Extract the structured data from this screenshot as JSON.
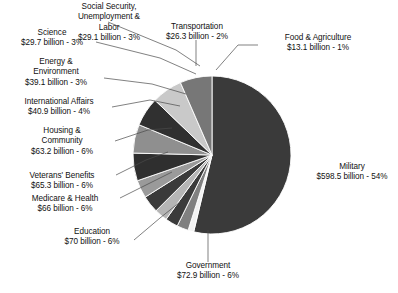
{
  "chart_data": {
    "type": "pie",
    "title": "",
    "subtitle": "",
    "xlabel": "",
    "ylabel": "",
    "legend_position": "callout-labels",
    "grid": false,
    "units": "billion USD",
    "start_angle_deg": 0,
    "direction": "clockwise",
    "categories": [
      "Military",
      "Food & Agriculture",
      "Transportation",
      "Social Security, Unemployment & Labor",
      "Science",
      "Energy & Environment",
      "International Affairs",
      "Housing & Community",
      "Veterans' Benefits",
      "Medicare & Health",
      "Education",
      "Government"
    ],
    "values": [
      598.5,
      13.1,
      26.3,
      29.1,
      29.7,
      39.1,
      40.9,
      63.2,
      65.3,
      66,
      70,
      72.9
    ],
    "percents": [
      54,
      1,
      2,
      3,
      3,
      3,
      4,
      6,
      6,
      6,
      6,
      6
    ],
    "colors": [
      "#3a3a3a",
      "#f2f2f2",
      "#808080",
      "#3a3a3a",
      "#b5b5b5",
      "#3a3a3a",
      "#9a9a9a",
      "#2f2f2f",
      "#8f8f8f",
      "#303030",
      "#c9c9c9",
      "#777777"
    ],
    "slices": [
      {
        "category": "Military",
        "value_text": "$598.5 billion",
        "percent_text": "54%",
        "label_line1": "Military",
        "label_line2": "$598.5 billion - 54%"
      },
      {
        "category": "Food & Agriculture",
        "value_text": "$13.1 billion",
        "percent_text": "1%",
        "label_line1": "Food & Agriculture",
        "label_line2": "$13.1 billion - 1%"
      },
      {
        "category": "Transportation",
        "value_text": "$26.3 billion",
        "percent_text": "2%",
        "label_line1": "Transportation",
        "label_line2": "$26.3 billion - 2%"
      },
      {
        "category": "Social Security, Unemployment & Labor",
        "value_text": "$29.1 billion",
        "percent_text": "3%",
        "label_line1": "Social Security,",
        "label_line2": "Unemployment &",
        "label_line3": "Labor",
        "label_line4": "$29.1 billion - 3%"
      },
      {
        "category": "Science",
        "value_text": "$29.7 billion",
        "percent_text": "3%",
        "label_line1": "Science",
        "label_line2": "$29.7 billion - 3%"
      },
      {
        "category": "Energy & Environment",
        "value_text": "$39.1 billion",
        "percent_text": "3%",
        "label_line1": "Energy &",
        "label_line2": "Environment",
        "label_line3": "$39.1 billion - 3%"
      },
      {
        "category": "International Affairs",
        "value_text": "$40.9 billion",
        "percent_text": "4%",
        "label_line1": "International Affairs",
        "label_line2": "$40.9 billion - 4%"
      },
      {
        "category": "Housing & Community",
        "value_text": "$63.2 billion",
        "percent_text": "6%",
        "label_line1": "Housing &",
        "label_line2": "Community",
        "label_line3": "$63.2 billion - 6%"
      },
      {
        "category": "Veterans' Benefits",
        "value_text": "$65.3 billion",
        "percent_text": "6%",
        "label_line1": "Veterans' Benefits",
        "label_line2": "$65.3 billion - 6%"
      },
      {
        "category": "Medicare & Health",
        "value_text": "$66 billion",
        "percent_text": "6%",
        "label_line1": "Medicare & Health",
        "label_line2": "$66 billion - 6%"
      },
      {
        "category": "Education",
        "value_text": "$70 billion",
        "percent_text": "6%",
        "label_line1": "Education",
        "label_line2": "$70 billion - 6%"
      },
      {
        "category": "Government",
        "value_text": "$72.9 billion",
        "percent_text": "6%",
        "label_line1": "Government",
        "label_line2": "$72.9 billion - 6%"
      }
    ]
  },
  "labels": {
    "social_security": {
      "l1": "Social Security,",
      "l2": "Unemployment &",
      "l3": "Labor",
      "l4": "$29.1 billion - 3%"
    },
    "transportation": {
      "l1": "Transportation",
      "l2": "$26.3 billion - 2%"
    },
    "food_agriculture": {
      "l1": "Food & Agriculture",
      "l2": "$13.1 billion - 1%"
    },
    "science": {
      "l1": "Science",
      "l2": "$29.7 billion - 3%"
    },
    "energy_environment": {
      "l1": "Energy &",
      "l2": "Environment",
      "l3": "$39.1 billion - 3%"
    },
    "international_affairs": {
      "l1": "International Affairs",
      "l2": "$40.9 billion - 4%"
    },
    "housing_community": {
      "l1": "Housing &",
      "l2": "Community",
      "l3": "$63.2 billion - 6%"
    },
    "veterans_benefits": {
      "l1": "Veterans' Benefits",
      "l2": "$65.3 billion - 6%"
    },
    "medicare_health": {
      "l1": "Medicare & Health",
      "l2": "$66 billion - 6%"
    },
    "education": {
      "l1": "Education",
      "l2": "$70 billion - 6%"
    },
    "government": {
      "l1": "Government",
      "l2": "$72.9 billion - 6%"
    },
    "military": {
      "l1": "Military",
      "l2": "$598.5 billion - 54%"
    }
  }
}
